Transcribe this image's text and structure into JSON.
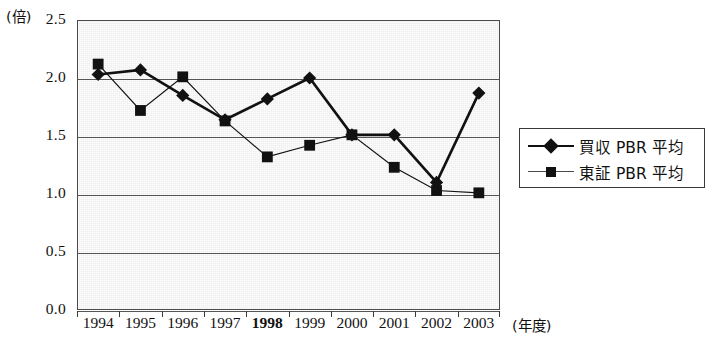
{
  "chart_data": {
    "type": "line",
    "title": "",
    "xlabel": "(年度)",
    "ylabel": "(倍)",
    "ylim": [
      0.0,
      2.5
    ],
    "ytick_step": 0.5,
    "grid": true,
    "legend_position": "right-outside",
    "categories": [
      "1994",
      "1995",
      "1996",
      "1997",
      "1998",
      "1999",
      "2000",
      "2001",
      "2002",
      "2003"
    ],
    "bold_categories": [
      "1998"
    ],
    "ytick_labels": [
      "2.5",
      "2.0",
      "1.5",
      "1.0",
      "0.5",
      "0.0"
    ],
    "ytick_values": [
      2.5,
      2.0,
      1.5,
      1.0,
      0.5,
      0.0
    ],
    "series": [
      {
        "name": "買収 PBR 平均",
        "marker": "diamond",
        "color": "#111111",
        "line_weight": "thick",
        "values": [
          2.03,
          2.07,
          1.85,
          1.64,
          1.82,
          2.0,
          1.51,
          1.51,
          1.1,
          1.87
        ]
      },
      {
        "name": "東証 PBR 平均",
        "marker": "square",
        "color": "#111111",
        "line_weight": "thin",
        "values": [
          2.12,
          1.72,
          2.01,
          1.63,
          1.32,
          1.42,
          1.51,
          1.23,
          1.03,
          1.01
        ]
      }
    ]
  },
  "legend": {
    "items": [
      {
        "label": "買収 PBR 平均",
        "marker": "diamond-marker"
      },
      {
        "label": "東証 PBR 平均",
        "marker": "square-marker"
      }
    ]
  },
  "axis": {
    "unit_label": "(倍)",
    "x_title": "(年度)"
  }
}
